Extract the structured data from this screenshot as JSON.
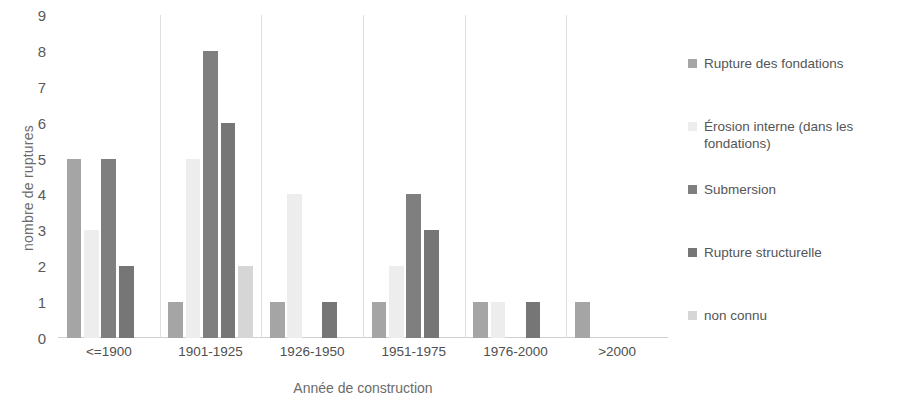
{
  "chart_data": {
    "type": "bar",
    "title": "",
    "subtitle": "",
    "xlabel": "Année de construction",
    "ylabel": "nombre de ruptures",
    "categories": [
      "<=1900",
      "1901-1925",
      "1926-1950",
      "1951-1975",
      "1976-2000",
      ">2000"
    ],
    "series": [
      {
        "name": "Rupture des fondations",
        "color": "#a5a5a5",
        "values": [
          5,
          1,
          1,
          1,
          1,
          1
        ]
      },
      {
        "name": "Érosion interne (dans les\nfondations)",
        "legend_text": "Érosion interne (dans les fondations)",
        "color": "#ededed",
        "values": [
          3,
          5,
          4,
          2,
          1,
          0
        ]
      },
      {
        "name": "Submersion",
        "color": "#7f7f7f",
        "values": [
          5,
          8,
          0,
          4,
          0,
          0
        ]
      },
      {
        "name": "Rupture structurelle",
        "color": "#767676",
        "values": [
          2,
          6,
          1,
          3,
          1,
          0
        ]
      },
      {
        "name": "non connu",
        "color": "#d6d6d6",
        "values": [
          0,
          2,
          0,
          0,
          0,
          0
        ]
      }
    ],
    "ylim": [
      0,
      9
    ],
    "ytick_labels": [
      "9",
      "8",
      "7",
      "6",
      "5",
      "4",
      "3",
      "2",
      "1",
      "0"
    ],
    "ytick_values": [
      9,
      8,
      7,
      6,
      5,
      4,
      3,
      2,
      1,
      0
    ],
    "grid": "vertical-category-separators",
    "legend_position": "right"
  },
  "axes": {
    "y_title": "nombre de ruptures",
    "x_title": "Année de construction"
  }
}
